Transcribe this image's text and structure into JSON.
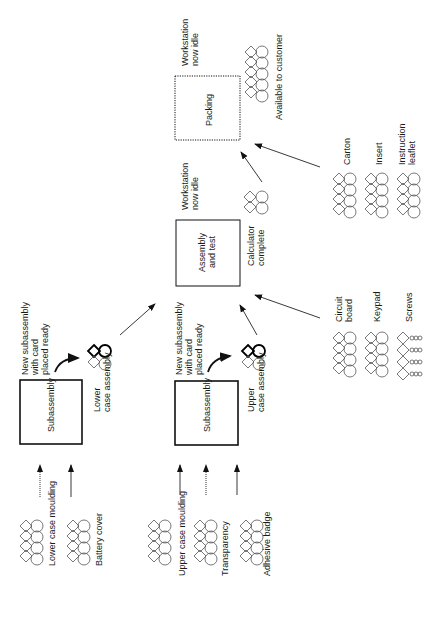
{
  "orientation": "rotated-90-ccw",
  "stations": {
    "lower_subassembly": {
      "label": "Subassembly",
      "output_note": [
        "New subassembly",
        "with card",
        "placed ready"
      ],
      "product": [
        "Lower",
        "case assembly"
      ]
    },
    "upper_subassembly": {
      "label": "Subassembly",
      "output_note": [
        "New subassembly",
        "with card",
        "placed ready"
      ],
      "product": [
        "Upper",
        "case assembly"
      ]
    },
    "assembly_test": {
      "label": [
        "Assembly",
        "and test"
      ],
      "status": [
        "Workstation",
        "now idle"
      ],
      "product": [
        "Calculator",
        "complete"
      ]
    },
    "packing": {
      "label": "Packing",
      "status": [
        "Workstation",
        "now idle"
      ],
      "product": "Available to customer"
    }
  },
  "inputs": {
    "lower": [
      {
        "label": "Lower case moulding",
        "arrow": "dotted"
      },
      {
        "label": "Battery cover",
        "arrow": "solid"
      }
    ],
    "upper": [
      {
        "label": "Upper case moulding",
        "arrow": "solid"
      },
      {
        "label": "Transparency",
        "arrow": "dotted"
      },
      {
        "label": "Adhesive badge",
        "arrow": "solid"
      }
    ],
    "assembly": [
      {
        "label": [
          "Circuit",
          "board"
        ]
      },
      {
        "label": "Keypad"
      },
      {
        "label": "Screws"
      }
    ],
    "packing": [
      {
        "label": "Carton"
      },
      {
        "label": "Insert"
      },
      {
        "label": [
          "Instruction",
          "leaflet"
        ]
      }
    ]
  }
}
